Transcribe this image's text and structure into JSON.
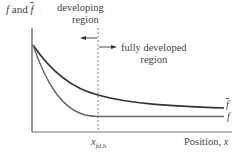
{
  "diagram": {
    "y_axis_label": {
      "f": "f",
      "and": "and",
      "fbar": "f"
    },
    "x_axis_label": {
      "text": "Position, ",
      "var": "x"
    },
    "marker_label": {
      "base": "x",
      "sub": "fd,h"
    },
    "regions": {
      "developing": {
        "line1": "developing",
        "line2": "region"
      },
      "fully_developed": {
        "line1": "fully developed",
        "line2": "region"
      }
    },
    "curves": [
      {
        "name": "f-bar",
        "label": "f",
        "overbar": true
      },
      {
        "name": "f",
        "label": "f",
        "overbar": false
      }
    ],
    "colors": {
      "axis": "#555555",
      "fbar_curve": "#333333",
      "f_curve": "#666666",
      "text": "#444444"
    }
  }
}
